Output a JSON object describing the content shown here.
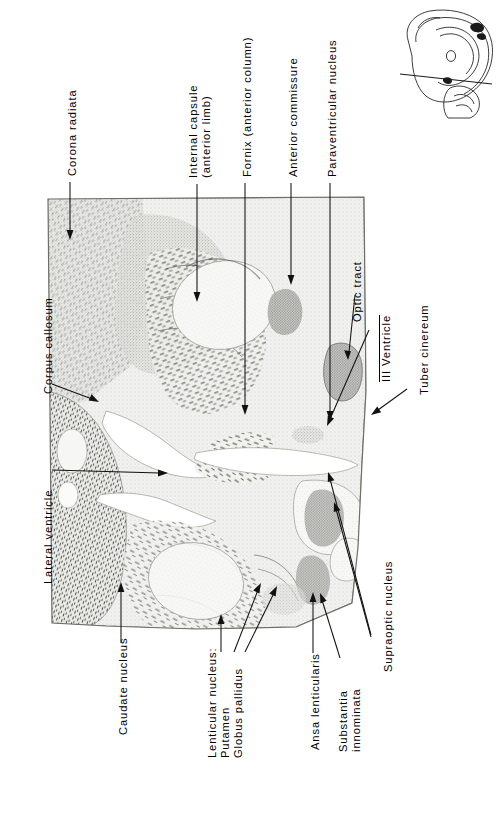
{
  "figure": {
    "type": "histological-atlas-plate",
    "orientation": "section rotated 90 degrees; labels read bottom-to-top",
    "background_color": "#ffffff",
    "ink_color": "#111111"
  },
  "labels": [
    {
      "id": "corona-radiata",
      "text": "Corona radiata",
      "lines": [
        "Corona radiata"
      ],
      "side": "top"
    },
    {
      "id": "internal-capsule",
      "text": "Internal capsule (anterior limb)",
      "lines": [
        "Internal  capsule",
        "(anterior  limb)"
      ],
      "side": "top"
    },
    {
      "id": "fornix",
      "text": "Fornix (anterior column)",
      "lines": [
        "Fornix (anterior column)"
      ],
      "side": "top"
    },
    {
      "id": "anterior-commissure",
      "text": "Anterior commissure",
      "lines": [
        "Anterior commissure"
      ],
      "side": "top"
    },
    {
      "id": "paraventricular-nucleus",
      "text": "Paraventricular nucleus",
      "lines": [
        "Paraventricular  nucleus"
      ],
      "side": "top"
    },
    {
      "id": "corpus-callosum",
      "text": "Corpus callosum",
      "lines": [
        "Corpus  callosum"
      ],
      "side": "left"
    },
    {
      "id": "lateral-ventricle",
      "text": "Lateral ventricle",
      "lines": [
        "Lateral  ventricle"
      ],
      "side": "left"
    },
    {
      "id": "optic-tract",
      "text": "Optic tract",
      "lines": [
        "Optic  tract"
      ],
      "side": "right"
    },
    {
      "id": "third-ventricle",
      "text": "III Ventricle",
      "lines": [
        "III Ventricle"
      ],
      "roman_numeral": "III",
      "side": "right"
    },
    {
      "id": "tuber-cinereum",
      "text": "Tuber cinereum",
      "lines": [
        "Tuber  cinereum"
      ],
      "side": "right"
    },
    {
      "id": "supraoptic-nucleus",
      "text": "Supraoptic nucleus",
      "lines": [
        "Supraoptic  nucleus"
      ],
      "side": "right-lower",
      "leader_count": 2
    },
    {
      "id": "caudate-nucleus",
      "text": "Caudate nucleus",
      "lines": [
        "Caudate  nucleus"
      ],
      "side": "bottom"
    },
    {
      "id": "lenticular-nucleus",
      "text": "Lenticular nucleus: Putamen Globus pallidus",
      "lines": [
        "Lenticular nucleus:",
        "Putamen",
        "Globus pallidus"
      ],
      "side": "bottom",
      "leader_count": 3
    },
    {
      "id": "ansa-lenticularis",
      "text": "Ansa lenticularis",
      "lines": [
        "Ansa lenticularis"
      ],
      "side": "bottom"
    },
    {
      "id": "substantia-innominata",
      "text": "Substantia innominata",
      "lines": [
        "Substantia",
        "innominata"
      ],
      "side": "bottom"
    }
  ],
  "inset": {
    "id": "orientation-inset",
    "description": "Small line drawing of medial surface of the brain with the plane of section indicated",
    "plane_of_section_shown": true
  }
}
